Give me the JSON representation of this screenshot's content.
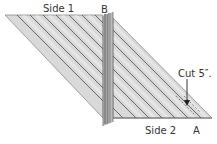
{
  "labels": {
    "side1": "Side 1",
    "side2": "Side 2",
    "point_b": "B",
    "point_a": "A",
    "cut": "Cut 5″."
  },
  "colors": {
    "fabric_fill": "#d9d9d9",
    "stripe_line": "#4a4a4a",
    "outline": "#8c8c8c",
    "seam_strip": "#a6a6a6",
    "seam_strip_dark": "#6e6e6e",
    "cut_line": "#7a7a7a",
    "arrow": "#222222"
  }
}
